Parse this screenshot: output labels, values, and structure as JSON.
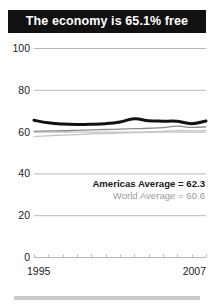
{
  "title": {
    "text": "The economy is 65.1% free"
  },
  "annotations": {
    "americas": "Americas Average = 62.3",
    "world": "World Average = 60.6"
  },
  "axis": {
    "x_start_label": "1995",
    "x_end_label": "2007"
  },
  "colors": {
    "title_background": "#111111",
    "title_text": "#ffffff",
    "country_line": "#111111",
    "americas_line": "#8c8c8c",
    "world_line": "#c4c4c4",
    "gridline": "#b8b8b8",
    "axis_text": "#1c1c1c",
    "bottom_rule": "#c9c9c9"
  },
  "chart_data": {
    "type": "line",
    "title": "The economy is 65.1% free",
    "xlabel": "",
    "ylabel": "",
    "xlim": [
      1995,
      2007
    ],
    "ylim": [
      0,
      100
    ],
    "grid": true,
    "legend": "none",
    "y_ticks": [
      0,
      20,
      40,
      60,
      80,
      100
    ],
    "y_tick_labels": [
      "0",
      "20",
      "40",
      "60",
      "80",
      "100"
    ],
    "x_ticks": [
      1995,
      1996,
      1997,
      1998,
      1999,
      2000,
      2001,
      2002,
      2003,
      2004,
      2005,
      2006,
      2007
    ],
    "x_tick_labels": [
      "1995",
      "",
      "",
      "",
      "",
      "",
      "",
      "",
      "",
      "",
      "",
      "",
      "2007"
    ],
    "x": [
      1995,
      1996,
      1997,
      1998,
      1999,
      2000,
      2001,
      2002,
      2003,
      2004,
      2005,
      2006,
      2007
    ],
    "series": [
      {
        "name": "Country",
        "color": "#111111",
        "width": 3.0,
        "values": [
          65.4,
          64.2,
          63.6,
          63.4,
          63.5,
          63.8,
          64.6,
          66.1,
          65.2,
          65.0,
          64.9,
          63.8,
          65.1
        ]
      },
      {
        "name": "Americas Average",
        "color": "#8c8c8c",
        "width": 1.3,
        "values": [
          60.1,
          60.3,
          60.4,
          60.6,
          60.8,
          61.0,
          61.2,
          61.4,
          61.6,
          61.9,
          62.6,
          62.0,
          62.3
        ]
      },
      {
        "name": "World Average",
        "color": "#c4c4c4",
        "width": 1.3,
        "values": [
          57.6,
          58.0,
          58.3,
          58.6,
          58.9,
          59.1,
          59.3,
          59.5,
          59.8,
          60.1,
          60.5,
          60.3,
          60.6
        ]
      }
    ],
    "annotations": [
      {
        "text": "Americas Average = 62.3",
        "value": 62.3
      },
      {
        "text": "World Average = 60.6",
        "value": 60.6
      }
    ]
  }
}
